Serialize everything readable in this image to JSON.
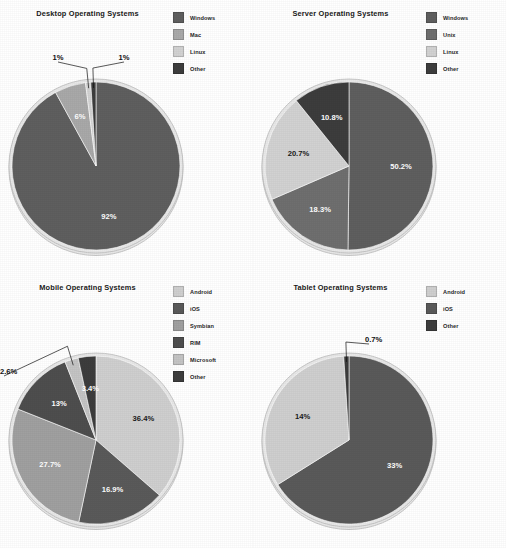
{
  "page": {
    "background": "#ffffff",
    "panel_count": 4
  },
  "palette": {
    "windows": "#5f5f5f",
    "mac": "#a9a9a9",
    "linux": "#d2d2d2",
    "other_dark": "#3d3d3d",
    "unix": "#6f6f6f",
    "android": "#cfcfcf",
    "ios": "#5a5a5a",
    "symbian": "#a0a0a0",
    "rim": "#4e4e4e",
    "microsoft": "#c4c4c4",
    "pie_rim": "#e8e8e8",
    "pie_rim_stroke": "#bdbdbd",
    "label_light": "#ffffff",
    "label_dark": "#111111"
  },
  "chart_data": [
    {
      "type": "pie",
      "id": "desktop",
      "title": "Desktop Operating Systems",
      "start_angle_deg": 0,
      "direction": "clockwise",
      "legend_position": "top-right",
      "categories": [
        "Windows",
        "Mac",
        "Linux",
        "Other"
      ],
      "values": [
        92,
        6,
        1,
        1
      ],
      "labels": [
        "92%",
        "6%",
        "1%",
        "1%"
      ],
      "colors": [
        "#5f5f5f",
        "#a9a9a9",
        "#d2d2d2",
        "#3d3d3d"
      ],
      "slices": [
        {
          "name": "Windows",
          "value": 92,
          "label": "92%",
          "color": "#5f5f5f",
          "label_style": "inside-light"
        },
        {
          "name": "Mac",
          "value": 6,
          "label": "6%",
          "color": "#a9a9a9",
          "label_style": "inside-light"
        },
        {
          "name": "Linux",
          "value": 1,
          "label": "1%",
          "color": "#d2d2d2",
          "label_style": "callout"
        },
        {
          "name": "Other",
          "value": 1,
          "label": "1%",
          "color": "#3d3d3d",
          "label_style": "callout"
        }
      ]
    },
    {
      "type": "pie",
      "id": "server",
      "title": "Server Operating Systems",
      "start_angle_deg": 0,
      "direction": "clockwise",
      "legend_position": "top-right",
      "categories": [
        "Windows",
        "Unix",
        "Linux",
        "Other"
      ],
      "values": [
        50.2,
        18.3,
        20.7,
        10.8
      ],
      "labels": [
        "50.2%",
        "18.3%",
        "20.7%",
        "10.8%"
      ],
      "colors": [
        "#5f5f5f",
        "#6f6f6f",
        "#d2d2d2",
        "#3d3d3d"
      ],
      "slices": [
        {
          "name": "Windows",
          "value": 50.2,
          "label": "50.2%",
          "color": "#5f5f5f",
          "label_style": "inside-light"
        },
        {
          "name": "Unix",
          "value": 18.3,
          "label": "18.3%",
          "color": "#6f6f6f",
          "label_style": "inside-light"
        },
        {
          "name": "Linux",
          "value": 20.7,
          "label": "20.7%",
          "color": "#d2d2d2",
          "label_style": "inside-dark"
        },
        {
          "name": "Other",
          "value": 10.8,
          "label": "10.8%",
          "color": "#3d3d3d",
          "label_style": "inside-light"
        }
      ]
    },
    {
      "type": "pie",
      "id": "mobile",
      "title": "Mobile Operating Systems",
      "start_angle_deg": 0,
      "direction": "clockwise",
      "legend_position": "top-right",
      "categories": [
        "Android",
        "iOS",
        "Symbian",
        "RIM",
        "Microsoft",
        "Other"
      ],
      "values": [
        36.4,
        16.9,
        27.7,
        13,
        2.6,
        3.4
      ],
      "labels": [
        "36.4%",
        "16.9%",
        "27.7%",
        "13%",
        "2.6%",
        "3.4%"
      ],
      "colors": [
        "#cfcfcf",
        "#5a5a5a",
        "#a0a0a0",
        "#4e4e4e",
        "#c4c4c4",
        "#3d3d3d"
      ],
      "slices": [
        {
          "name": "Android",
          "value": 36.4,
          "label": "36.4%",
          "color": "#cfcfcf",
          "label_style": "inside-dark"
        },
        {
          "name": "iOS",
          "value": 16.9,
          "label": "16.9%",
          "color": "#5a5a5a",
          "label_style": "inside-light"
        },
        {
          "name": "Symbian",
          "value": 27.7,
          "label": "27.7%",
          "color": "#a0a0a0",
          "label_style": "inside-light"
        },
        {
          "name": "RIM",
          "value": 13,
          "label": "13%",
          "color": "#4e4e4e",
          "label_style": "inside-light"
        },
        {
          "name": "Microsoft",
          "value": 2.6,
          "label": "2.6%",
          "color": "#c4c4c4",
          "label_style": "callout"
        },
        {
          "name": "Other",
          "value": 3.4,
          "label": "3.4%",
          "color": "#3d3d3d",
          "label_style": "inside-light"
        }
      ]
    },
    {
      "type": "pie",
      "id": "tablet",
      "title": "Tablet Operating Systems",
      "start_angle_deg": 0,
      "direction": "clockwise",
      "legend_position": "top-right",
      "categories": [
        "Android",
        "iOS",
        "Other"
      ],
      "values": [
        33,
        14,
        0.7
      ],
      "labels": [
        "33%",
        "14%",
        "0.7%"
      ],
      "colors": [
        "#cfcfcf",
        "#5a5a5a",
        "#3d3d3d"
      ],
      "slices": [
        {
          "name": "iOS",
          "value": 33,
          "label": "33%",
          "color": "#5a5a5a",
          "label_style": "inside-light",
          "sweep": 66.1
        },
        {
          "name": "Android",
          "value": 14,
          "label": "14%",
          "color": "#cfcfcf",
          "label_style": "inside-dark",
          "sweep": 32.9
        },
        {
          "name": "Other",
          "value": 0.7,
          "label": "0.7%",
          "color": "#3d3d3d",
          "label_style": "callout",
          "sweep": 1.0
        }
      ]
    }
  ]
}
